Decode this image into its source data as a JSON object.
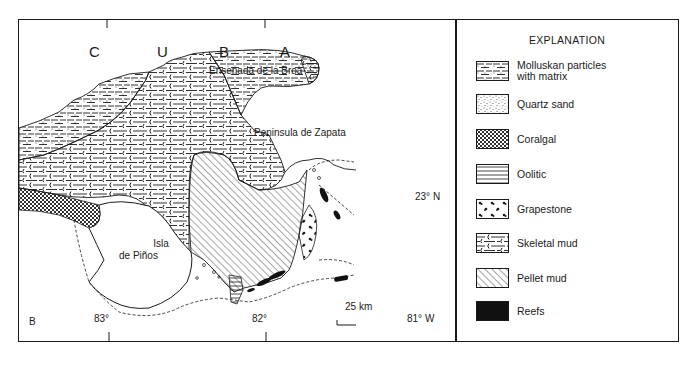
{
  "figure": {
    "panel_letter": "B",
    "map": {
      "country_label_letters": [
        "C",
        "U",
        "B",
        "A"
      ],
      "place_labels": {
        "ensenada": "Ensenada de la Broa",
        "peninsula": "Peninsula de Zapata",
        "isla_line1": "Isla",
        "isla_line2": "de Piños"
      },
      "latitude_label": "23° N",
      "longitude_labels": [
        "83°",
        "82°",
        "81° W"
      ],
      "scale_bar": "25 km"
    },
    "legend": {
      "title": "EXPLANATION",
      "items": [
        {
          "label_line1": "Molluskan particles",
          "label_line2": "with matrix",
          "pattern": "dash-dot"
        },
        {
          "label_line1": "Quartz sand",
          "label_line2": "",
          "pattern": "stipple"
        },
        {
          "label_line1": "Coralgal",
          "label_line2": "",
          "pattern": "crosshatch"
        },
        {
          "label_line1": "Oolitic",
          "label_line2": "",
          "pattern": "horizontal-lines"
        },
        {
          "label_line1": "Grapestone",
          "label_line2": "",
          "pattern": "clusters"
        },
        {
          "label_line1": "Skeletal mud",
          "label_line2": "",
          "pattern": "shell-dash"
        },
        {
          "label_line1": "Pellet mud",
          "label_line2": "",
          "pattern": "diagonal-hatch"
        },
        {
          "label_line1": "Reefs",
          "label_line2": "",
          "pattern": "solid-black"
        }
      ]
    },
    "colors": {
      "ink": "#1a1a1a",
      "paper": "#ffffff"
    }
  }
}
